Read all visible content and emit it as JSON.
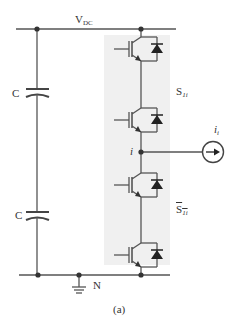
{
  "diagram": {
    "caption": "(a)",
    "labels": {
      "dc_bus": {
        "main": "V",
        "sub": "DC"
      },
      "cap_top": "C",
      "cap_bottom": "C",
      "switch_top": {
        "main": "S",
        "sub": "1i"
      },
      "switch_bottom": {
        "main": "S",
        "sub": "1i",
        "overline": true
      },
      "node_out": "i",
      "current_source": {
        "main": "i",
        "sub": "i"
      },
      "neutral": "N"
    },
    "colors": {
      "wire": "#555555",
      "node": "#333333",
      "shade": "#f0f0f0",
      "text": "#333333"
    },
    "components": [
      {
        "type": "dc-rail",
        "name": "positive rail",
        "label": "VDC"
      },
      {
        "type": "capacitor",
        "name": "upper capacitor",
        "label": "C"
      },
      {
        "type": "capacitor",
        "name": "lower capacitor",
        "label": "C"
      },
      {
        "type": "igbt-diode",
        "name": "upper switch 1",
        "group": "S1i"
      },
      {
        "type": "igbt-diode",
        "name": "upper switch 2",
        "group": "S1i"
      },
      {
        "type": "igbt-diode",
        "name": "lower switch 1",
        "group": "S1i-bar"
      },
      {
        "type": "igbt-diode",
        "name": "lower switch 2",
        "group": "S1i-bar"
      },
      {
        "type": "current-source",
        "name": "load current",
        "label": "ii"
      },
      {
        "type": "ground",
        "name": "neutral ground",
        "label": "N"
      },
      {
        "type": "dc-rail",
        "name": "negative rail"
      }
    ]
  }
}
